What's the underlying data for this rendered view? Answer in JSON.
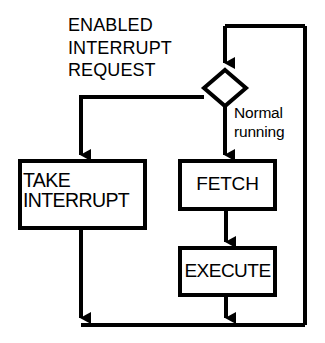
{
  "diagram": {
    "stroke_color": "#000000",
    "background_color": "#ffffff",
    "nodes": {
      "decision": {
        "shape": "diamond",
        "label": ""
      },
      "take_interrupt": {
        "shape": "rectangle",
        "label": "TAKE\nINTERRUPT"
      },
      "fetch": {
        "shape": "rectangle",
        "label": "FETCH"
      },
      "execute": {
        "shape": "rectangle",
        "label": "EXECUTE"
      }
    },
    "edge_labels": {
      "interrupt_branch": "ENABLED\nINTERRUPT\nREQUEST",
      "normal_branch": "Normal\nrunning"
    }
  }
}
